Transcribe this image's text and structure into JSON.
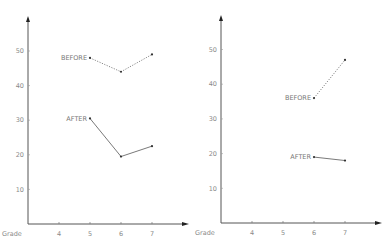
{
  "chart_data": [
    {
      "type": "line",
      "title": "",
      "xlabel": "Grade",
      "ylabel": "",
      "x_ticks": [
        "4",
        "5",
        "6",
        "7"
      ],
      "y_ticks": [
        "10",
        "20",
        "30",
        "40",
        "50"
      ],
      "ylim": [
        0,
        60
      ],
      "xlim": [
        3,
        8
      ],
      "grid": false,
      "legend": "inline labels",
      "series": [
        {
          "name": "BEFORE",
          "style": "dotted",
          "x": [
            5,
            6,
            7
          ],
          "values": [
            48,
            44,
            49
          ]
        },
        {
          "name": "AFTER",
          "style": "solid",
          "x": [
            5,
            6,
            7
          ],
          "values": [
            30.5,
            19.5,
            22.5
          ]
        }
      ]
    },
    {
      "type": "line",
      "title": "",
      "xlabel": "Grade",
      "ylabel": "",
      "x_ticks": [
        "4",
        "5",
        "6",
        "7"
      ],
      "y_ticks": [
        "10",
        "20",
        "30",
        "40",
        "50"
      ],
      "ylim": [
        0,
        60
      ],
      "xlim": [
        3,
        8
      ],
      "grid": false,
      "legend": "inline labels",
      "series": [
        {
          "name": "BEFORE",
          "style": "dotted",
          "x": [
            6,
            7
          ],
          "values": [
            36,
            47
          ]
        },
        {
          "name": "AFTER",
          "style": "solid",
          "x": [
            6,
            7
          ],
          "values": [
            19,
            18
          ]
        }
      ]
    }
  ],
  "colors": {
    "axis": "#555555",
    "line": "#6a6a6a",
    "text": "#777777"
  }
}
